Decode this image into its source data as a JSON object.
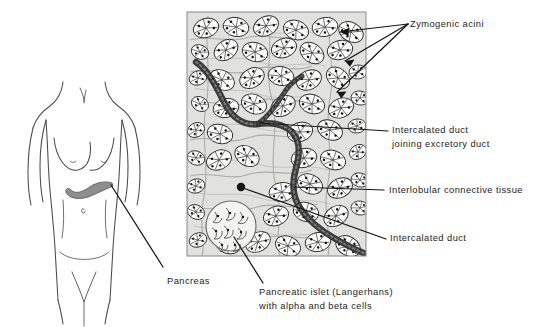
{
  "figure": {
    "background_color": "#ffffff",
    "ink_color": "#1b1b1b",
    "tissue_tint": "#b9b9b9",
    "pancreas_fill": "#8e8e8e"
  },
  "body_diagram": {
    "name": "female torso anterior view",
    "organ_label": "Pancreas",
    "organ_name": "pancreas",
    "outline_color": "#3a3a3a"
  },
  "histology_panel": {
    "name": "pancreas photomicrograph",
    "border_color": "#777777"
  },
  "labels": [
    {
      "id": "zymogenic-acini",
      "text": "Zymogenic acini"
    },
    {
      "id": "intercalated-duct-joining",
      "line1": "Intercalated duct",
      "line2": "joining excretory duct"
    },
    {
      "id": "interlobular-connective-tissue",
      "text": "Interlobular connective tissue"
    },
    {
      "id": "intercalated-duct",
      "text": "Intercalated duct"
    },
    {
      "id": "pancreatic-islet",
      "line1": "Pancreatic islet (Langerhans)",
      "line2": "with alpha and beta cells"
    },
    {
      "id": "pancreas",
      "text": "Pancreas"
    }
  ]
}
